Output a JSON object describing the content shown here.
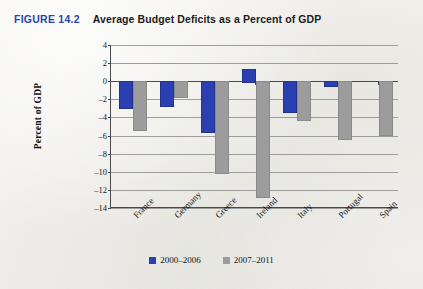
{
  "figure": {
    "tag": "FIGURE 14.2",
    "title": "Average Budget Deficits as a Percent of GDP"
  },
  "colors": {
    "series_2000_2006": "#2a3fb0",
    "series_2007_2011": "#9c9c9c",
    "figure_tag": "#2a46a8",
    "page_background": "#f4f3ef"
  },
  "legend": {
    "position": "bottom-center",
    "entries": [
      {
        "label": "2000–2006",
        "color": "#2a3fb0"
      },
      {
        "label": "2007–2011",
        "color": "#9c9c9c"
      }
    ]
  },
  "chart_data": {
    "type": "bar",
    "title": "Average Budget Deficits as a Percent of GDP",
    "xlabel": "",
    "ylabel": "Percent of GDP",
    "ylim": [
      -14,
      4
    ],
    "ytick_step": 2,
    "yticks": [
      4,
      2,
      0,
      -2,
      -4,
      -6,
      -8,
      -10,
      -12,
      -14
    ],
    "ytick_labels": [
      "4",
      "2",
      "0",
      "–2",
      "–4",
      "–6",
      "–8",
      "–10",
      "–12",
      "–14"
    ],
    "grid": true,
    "categories": [
      "France",
      "Germany",
      "Greece",
      "Ireland",
      "Italy",
      "Portugal",
      "Spain"
    ],
    "series": [
      {
        "name": "2000–2006",
        "color": "#2a3fb0",
        "values": [
          -2.9,
          -2.6,
          -5.5,
          1.4,
          -3.3,
          -0.4,
          0.0
        ]
      },
      {
        "name": "2007–2011",
        "color": "#9c9c9c",
        "values": [
          -5.3,
          -1.6,
          -10.0,
          -12.7,
          -4.2,
          -6.3,
          -5.8
        ]
      }
    ]
  }
}
